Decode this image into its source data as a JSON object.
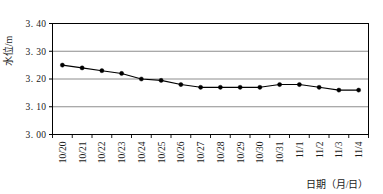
{
  "chart_data": {
    "type": "line",
    "title": "",
    "xlabel": "日期（月/日）",
    "ylabel": "水位/m",
    "categories": [
      "10/20",
      "10/21",
      "10/22",
      "10/23",
      "10/24",
      "10/25",
      "10/26",
      "10/27",
      "10/28",
      "10/29",
      "10/30",
      "10/31",
      "11/1",
      "11/2",
      "11/3",
      "11/4"
    ],
    "values": [
      3.25,
      3.24,
      3.23,
      3.22,
      3.2,
      3.195,
      3.18,
      3.17,
      3.17,
      3.17,
      3.17,
      3.18,
      3.18,
      3.17,
      3.16,
      3.16
    ],
    "series": [
      {
        "name": "水位",
        "values": [
          3.25,
          3.24,
          3.23,
          3.22,
          3.2,
          3.195,
          3.18,
          3.17,
          3.17,
          3.17,
          3.17,
          3.18,
          3.18,
          3.17,
          3.16,
          3.16
        ]
      }
    ],
    "ylim": [
      3.0,
      3.4
    ],
    "yticks": [
      3.0,
      3.1,
      3.2,
      3.3,
      3.4
    ],
    "ytick_labels": [
      "3. 00",
      "3. 10",
      "3. 20",
      "3. 30",
      "3. 40"
    ],
    "grid": "horizontal",
    "legend": "none",
    "marker": "filled-circle",
    "line_color": "#000000",
    "marker_color": "#000000",
    "grid_color": "#808080",
    "axis_color": "#000000",
    "background": "#ffffff"
  }
}
